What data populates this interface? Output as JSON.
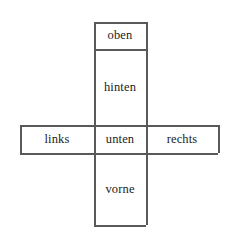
{
  "figure": {
    "kind": "cube-net-diagram",
    "background_color": "#ffffff",
    "line_color": "#595959",
    "text_color": "#1c1c1c",
    "width": 232,
    "height": 238
  },
  "cells": [
    {
      "id": "oben",
      "label": "oben",
      "position": "top",
      "x": 94,
      "y": 22,
      "w": 52,
      "h": 27
    },
    {
      "id": "hinten",
      "label": "hinten",
      "position": "upper-middle",
      "x": 94,
      "y": 49,
      "w": 52,
      "h": 76
    },
    {
      "id": "links",
      "label": "links",
      "position": "left",
      "x": 20,
      "y": 125,
      "w": 74,
      "h": 28
    },
    {
      "id": "unten",
      "label": "unten",
      "position": "center",
      "x": 94,
      "y": 125,
      "w": 52,
      "h": 28
    },
    {
      "id": "rechts",
      "label": "rechts",
      "position": "right",
      "x": 146,
      "y": 125,
      "w": 72,
      "h": 28
    },
    {
      "id": "vorne",
      "label": "vorne",
      "position": "bottom",
      "x": 94,
      "y": 153,
      "w": 52,
      "h": 72
    }
  ],
  "strokes": {
    "horizontal": [
      {
        "id": "top-of-oben",
        "x": 94,
        "y": 22,
        "length": 52
      },
      {
        "id": "oben-hinten-seam",
        "x": 94,
        "y": 49,
        "length": 52
      },
      {
        "id": "top-of-band",
        "x": 20,
        "y": 125,
        "length": 198
      },
      {
        "id": "bottom-of-band",
        "x": 20,
        "y": 153,
        "length": 198
      },
      {
        "id": "bottom-of-vorne",
        "x": 94,
        "y": 225,
        "length": 52
      }
    ],
    "vertical": [
      {
        "id": "column-left",
        "x": 94,
        "y": 22,
        "length": 203
      },
      {
        "id": "column-right",
        "x": 146,
        "y": 22,
        "length": 203
      },
      {
        "id": "links-left",
        "x": 20,
        "y": 125,
        "length": 28
      },
      {
        "id": "rechts-right",
        "x": 218,
        "y": 125,
        "length": 28
      }
    ]
  }
}
